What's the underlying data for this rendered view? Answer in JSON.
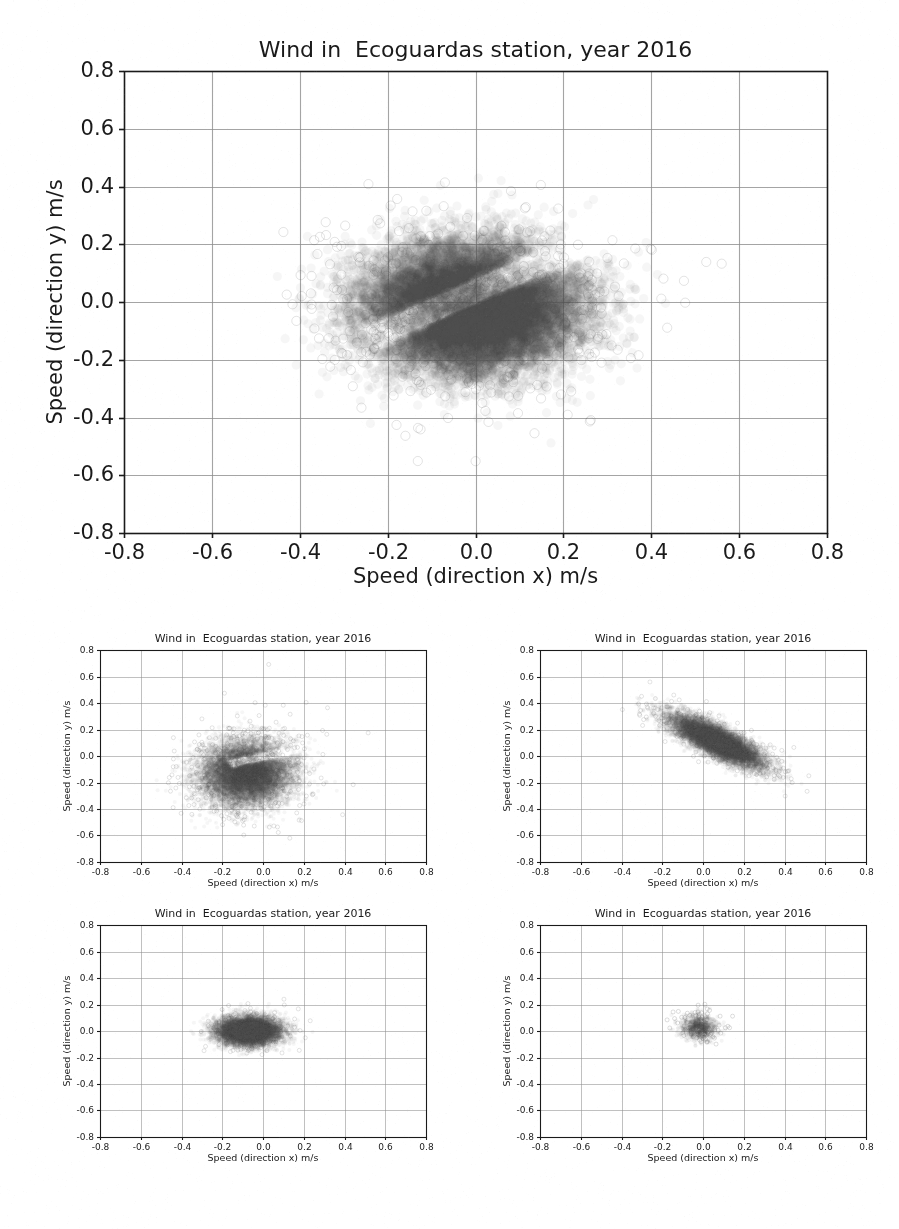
{
  "document": {
    "kind": "scanned-figure-page",
    "background_color": "#ffffff",
    "ink_color": "#1a1a1a",
    "grid_color": "#8d8d8d",
    "marker_color": "#4a4a4a"
  },
  "chart_data": [
    {
      "id": "main",
      "type": "scatter",
      "title": "Wind in  Ecoguardas station, year 2016",
      "xlabel": "Speed (direction x) m/s",
      "ylabel": "Speed (direction y) m/s",
      "xlim": [
        -0.8,
        0.8
      ],
      "ylim": [
        -0.8,
        0.8
      ],
      "xticks": [
        "-0.8",
        "-0.6",
        "-0.4",
        "-0.2",
        "0.0",
        "0.2",
        "0.4",
        "0.6",
        "0.8"
      ],
      "yticks": [
        "0.8",
        "0.6",
        "0.4",
        "0.2",
        "0.0",
        "-0.2",
        "-0.4",
        "-0.6",
        "-0.8"
      ],
      "xtick_values": [
        -0.8,
        -0.6,
        -0.4,
        -0.2,
        0.0,
        0.2,
        0.4,
        0.6,
        0.8
      ],
      "ytick_values": [
        0.8,
        0.6,
        0.4,
        0.2,
        0.0,
        -0.2,
        -0.4,
        -0.6,
        -0.8
      ],
      "grid": true,
      "legend": "none",
      "marker": {
        "shape": "circle",
        "size_px": 9,
        "alpha": 0.05,
        "edge": true
      },
      "cloud": {
        "n_points": 22000,
        "center": [
          -0.01,
          -0.02
        ],
        "sigma": [
          0.115,
          0.105
        ],
        "rotation_deg": 0,
        "gap": {
          "present": true,
          "angle_deg": 34,
          "center": [
            0.035,
            0.06
          ],
          "width": 0.045,
          "length": 0.34
        },
        "halo_points": 650,
        "halo_sigma_scale": 1.55
      }
    },
    {
      "id": "subplot-0",
      "type": "scatter",
      "title": "Wind in  Ecoguardas station, year 2016",
      "xlabel": "Speed (direction x) m/s",
      "ylabel": "Speed (direction y) m/s",
      "xlim": [
        -0.8,
        0.8
      ],
      "ylim": [
        -0.8,
        0.8
      ],
      "xticks": [
        "-0.8",
        "-0.6",
        "-0.4",
        "-0.2",
        "0.0",
        "0.2",
        "0.4",
        "0.6",
        "0.8"
      ],
      "yticks": [
        "0.8",
        "0.6",
        "0.4",
        "0.2",
        "0.0",
        "-0.2",
        "-0.4",
        "-0.6",
        "-0.8"
      ],
      "xtick_values": [
        -0.8,
        -0.6,
        -0.4,
        -0.2,
        0.0,
        0.2,
        0.4,
        0.6,
        0.8
      ],
      "ytick_values": [
        0.8,
        0.6,
        0.4,
        0.2,
        0.0,
        -0.2,
        -0.4,
        -0.6,
        -0.8
      ],
      "grid": true,
      "legend": "none",
      "marker": {
        "shape": "circle",
        "size_px": 4,
        "alpha": 0.05,
        "edge": true
      },
      "cloud": {
        "n_points": 14000,
        "center": [
          -0.08,
          -0.13
        ],
        "sigma": [
          0.105,
          0.115
        ],
        "rotation_deg": -18,
        "gap": {
          "present": true,
          "angle_deg": 18,
          "center": [
            0.02,
            0.0
          ],
          "width": 0.035,
          "length": 0.2
        },
        "halo_points": 500,
        "halo_sigma_scale": 1.6
      }
    },
    {
      "id": "subplot-1",
      "type": "scatter",
      "title": "Wind in  Ecoguardas station, year 2016",
      "xlabel": "Speed (direction x) m/s",
      "ylabel": "Speed (direction y) m/s",
      "xlim": [
        -0.8,
        0.8
      ],
      "ylim": [
        -0.8,
        0.8
      ],
      "xticks": [
        "-0.8",
        "-0.6",
        "-0.4",
        "-0.2",
        "0.0",
        "0.2",
        "0.4",
        "0.6",
        "0.8"
      ],
      "yticks": [
        "0.8",
        "0.6",
        "0.4",
        "0.2",
        "0.0",
        "-0.2",
        "-0.4",
        "-0.6",
        "-0.8"
      ],
      "xtick_values": [
        -0.8,
        -0.6,
        -0.4,
        -0.2,
        0.0,
        0.2,
        0.4,
        0.6,
        0.8
      ],
      "ytick_values": [
        0.8,
        0.6,
        0.4,
        0.2,
        0.0,
        -0.2,
        -0.4,
        -0.6,
        -0.8
      ],
      "grid": true,
      "legend": "none",
      "marker": {
        "shape": "circle",
        "size_px": 4,
        "alpha": 0.05,
        "edge": true
      },
      "cloud": {
        "n_points": 13000,
        "center": [
          0.07,
          0.11
        ],
        "sigma": [
          0.135,
          0.045
        ],
        "rotation_deg": -40,
        "gap": {
          "present": false
        },
        "halo_points": 400,
        "halo_sigma_scale": 1.5
      }
    },
    {
      "id": "subplot-2",
      "type": "scatter",
      "title": "Wind in  Ecoguardas station, year 2016",
      "xlabel": "Speed (direction x) m/s",
      "ylabel": "Speed (direction y) m/s",
      "xlim": [
        -0.8,
        0.8
      ],
      "ylim": [
        -0.8,
        0.8
      ],
      "xticks": [
        "-0.8",
        "-0.6",
        "-0.4",
        "-0.2",
        "0.0",
        "0.2",
        "0.4",
        "0.6",
        "0.8"
      ],
      "yticks": [
        "0.8",
        "0.6",
        "0.4",
        "0.2",
        "0.0",
        "-0.2",
        "-0.4",
        "-0.6",
        "-0.8"
      ],
      "xtick_values": [
        -0.8,
        -0.6,
        -0.4,
        -0.2,
        0.0,
        0.2,
        0.4,
        0.6,
        0.8
      ],
      "ytick_values": [
        0.8,
        0.6,
        0.4,
        0.2,
        0.0,
        -0.2,
        -0.4,
        -0.6,
        -0.8
      ],
      "grid": true,
      "legend": "none",
      "marker": {
        "shape": "circle",
        "size_px": 4,
        "alpha": 0.05,
        "edge": true
      },
      "cloud": {
        "n_points": 11000,
        "center": [
          -0.07,
          0.0
        ],
        "sigma": [
          0.075,
          0.052
        ],
        "rotation_deg": 0,
        "gap": {
          "present": false
        },
        "halo_points": 260,
        "halo_sigma_scale": 1.35
      }
    },
    {
      "id": "subplot-3",
      "type": "scatter",
      "title": "Wind in  Ecoguardas station, year 2016",
      "xlabel": "Speed (direction x) m/s",
      "ylabel": "Speed (direction y) m/s",
      "xlim": [
        -0.8,
        0.8
      ],
      "ylim": [
        -0.8,
        0.8
      ],
      "xticks": [
        "-0.8",
        "-0.6",
        "-0.4",
        "-0.2",
        "0.0",
        "0.2",
        "0.4",
        "0.6",
        "0.8"
      ],
      "yticks": [
        "0.8",
        "0.6",
        "0.4",
        "0.2",
        "0.0",
        "-0.2",
        "-0.4",
        "-0.6",
        "-0.8"
      ],
      "xtick_values": [
        -0.8,
        -0.6,
        -0.4,
        -0.2,
        0.0,
        0.2,
        0.4,
        0.6,
        0.8
      ],
      "ytick_values": [
        0.8,
        0.6,
        0.4,
        0.2,
        0.0,
        -0.2,
        -0.4,
        -0.6,
        -0.8
      ],
      "grid": true,
      "legend": "none",
      "marker": {
        "shape": "circle",
        "size_px": 4,
        "alpha": 0.06,
        "edge": true
      },
      "cloud": {
        "n_points": 900,
        "center": [
          -0.02,
          0.03
        ],
        "sigma": [
          0.042,
          0.045
        ],
        "rotation_deg": 0,
        "gap": {
          "present": false
        },
        "halo_points": 90,
        "halo_sigma_scale": 1.5
      }
    }
  ]
}
